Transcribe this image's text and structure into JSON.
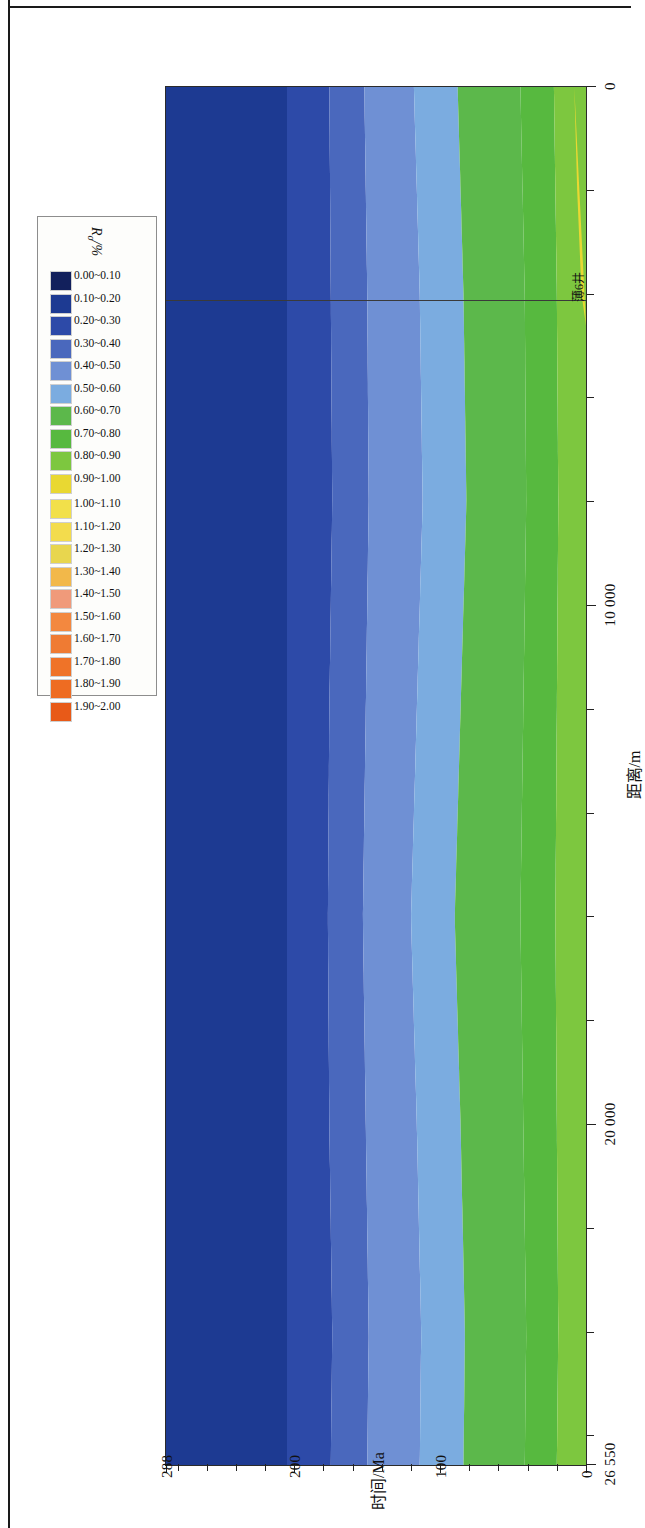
{
  "figure": {
    "x_axis": {
      "title": "距离/m",
      "tick_labels": [
        "0",
        "10 000",
        "20 000",
        "26 550"
      ],
      "tick_values": [
        0,
        10000,
        20000,
        26550
      ],
      "min": 0,
      "max": 26550,
      "minor_tick_step": 2000
    },
    "y_axis": {
      "title": "时间/Ma",
      "tick_labels": [
        "0",
        "100",
        "200",
        "288"
      ],
      "tick_values": [
        0,
        100,
        200,
        288
      ],
      "min": 0,
      "max": 288,
      "minor_tick_step": 20
    },
    "annotations": [
      {
        "name": "well-marker",
        "label": "薄6井",
        "x": 4100
      }
    ]
  },
  "legend": {
    "title": "R_o/%",
    "title_symbol": "R",
    "title_sub": "o",
    "title_unit": "/%",
    "row_low": [
      {
        "label": "0.00~0.10",
        "color": "#12205c"
      },
      {
        "label": "0.10~0.20",
        "color": "#1d3a92"
      },
      {
        "label": "0.20~0.30",
        "color": "#2d4aa8"
      },
      {
        "label": "0.30~0.40",
        "color": "#4a68bd"
      },
      {
        "label": "0.40~0.50",
        "color": "#6f90d4"
      },
      {
        "label": "0.50~0.60",
        "color": "#7bace0"
      },
      {
        "label": "0.60~0.70",
        "color": "#5cb84b"
      },
      {
        "label": "0.70~0.80",
        "color": "#57b93f"
      },
      {
        "label": "0.80~0.90",
        "color": "#7dc73f"
      },
      {
        "label": "0.90~1.00",
        "color": "#e9d832"
      }
    ],
    "row_high": [
      {
        "label": "1.00~1.10",
        "color": "#f2e04a"
      },
      {
        "label": "1.10~1.20",
        "color": "#f3dc4d"
      },
      {
        "label": "1.20~1.30",
        "color": "#e8d64e"
      },
      {
        "label": "1.30~1.40",
        "color": "#f2b84a"
      },
      {
        "label": "1.40~1.50",
        "color": "#f09a7a"
      },
      {
        "label": "1.50~1.60",
        "color": "#f3883f"
      },
      {
        "label": "1.60~1.70",
        "color": "#ef7b33"
      },
      {
        "label": "1.70~1.80",
        "color": "#ef7328"
      },
      {
        "label": "1.80~1.90",
        "color": "#ee6c22"
      },
      {
        "label": "1.90~2.00",
        "color": "#e85a18"
      }
    ]
  },
  "chart_data": {
    "type": "area",
    "title": "",
    "subtitle": "",
    "xlabel": "距离/m",
    "ylabel": "时间/Ma",
    "xlim": [
      0,
      26550
    ],
    "ylim": [
      0,
      288
    ],
    "grid": false,
    "legend_position": "bottom-right",
    "value_label": "R_o/%",
    "bands": [
      {
        "range": "0.90~1.00",
        "color": "#e9d832",
        "time_start": 0,
        "time_end": 7,
        "note": "thin yellow band near t=0, pinches out after ~4500 m"
      },
      {
        "range": "0.80~0.90",
        "color": "#7dc73f",
        "time_start": 3,
        "time_end": 22
      },
      {
        "range": "0.70~0.80",
        "color": "#57b93f",
        "time_start": 22,
        "time_end": 45
      },
      {
        "range": "0.60~0.70",
        "color": "#5cb84b",
        "time_start": 45,
        "time_end": 88
      },
      {
        "range": "0.50~0.60",
        "color": "#7bace0",
        "time_start": 88,
        "time_end": 118
      },
      {
        "range": "0.40~0.50",
        "color": "#6f90d4",
        "time_start": 118,
        "time_end": 152
      },
      {
        "range": "0.30~0.40",
        "color": "#4a68bd",
        "time_start": 152,
        "time_end": 176
      },
      {
        "range": "0.20~0.30",
        "color": "#2d4aa8",
        "time_start": 176,
        "time_end": 205
      },
      {
        "range": "0.10~0.20",
        "color": "#1d3a92",
        "time_start": 205,
        "time_end": 205
      }
    ],
    "series": [
      {
        "name": "0.90~1.00 upper boundary",
        "x": [
          0,
          2000,
          4000,
          4600
        ],
        "values": [
          8,
          6,
          3,
          0
        ]
      },
      {
        "name": "0.80~0.90 upper boundary",
        "x": [
          0,
          4000,
          8000,
          12000,
          16000,
          20000,
          24000,
          26550
        ],
        "values": [
          22,
          20,
          19,
          20,
          21,
          20,
          19,
          20
        ]
      },
      {
        "name": "0.70~0.80 upper boundary",
        "x": [
          0,
          4000,
          8000,
          12000,
          16000,
          20000,
          24000,
          26550
        ],
        "values": [
          45,
          42,
          41,
          43,
          45,
          43,
          41,
          42
        ]
      },
      {
        "name": "0.60~0.70 upper boundary",
        "x": [
          0,
          4000,
          8000,
          12000,
          16000,
          20000,
          24000,
          26550
        ],
        "values": [
          88,
          84,
          82,
          86,
          90,
          86,
          83,
          84
        ]
      },
      {
        "name": "0.50~0.60 upper boundary",
        "x": [
          0,
          4000,
          8000,
          12000,
          16000,
          20000,
          24000,
          26550
        ],
        "values": [
          118,
          114,
          112,
          116,
          120,
          116,
          113,
          114
        ]
      },
      {
        "name": "0.40~0.50 upper boundary",
        "x": [
          0,
          4000,
          8000,
          12000,
          16000,
          20000,
          24000,
          26550
        ],
        "values": [
          152,
          150,
          149,
          151,
          153,
          151,
          149,
          150
        ]
      },
      {
        "name": "0.30~0.40 upper boundary",
        "x": [
          0,
          4000,
          8000,
          12000,
          16000,
          20000,
          24000,
          26550
        ],
        "values": [
          176,
          175,
          174,
          176,
          177,
          176,
          174,
          175
        ]
      },
      {
        "name": "0.20~0.30 upper boundary",
        "x": [
          0,
          4000,
          8000,
          12000,
          16000,
          20000,
          24000,
          26550
        ],
        "values": [
          205,
          205,
          205,
          205,
          205,
          205,
          205,
          205
        ]
      }
    ]
  }
}
